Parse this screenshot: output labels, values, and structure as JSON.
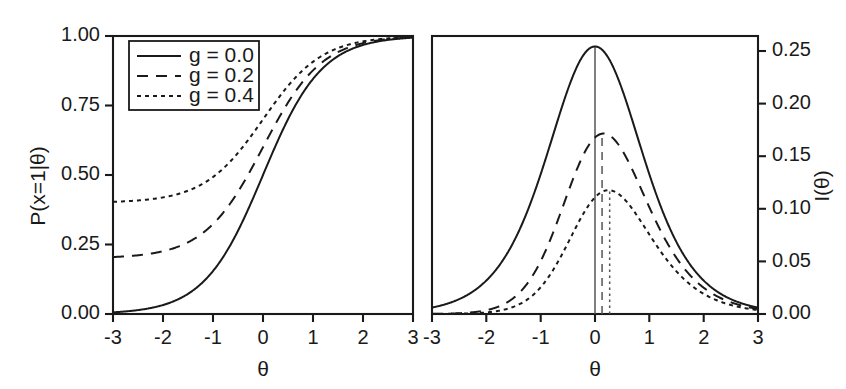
{
  "figure": {
    "background": "#ffffff",
    "ink_color": "#1a1a1a",
    "vline_color": "#555555"
  },
  "legend": {
    "position": "top-left-of-left-panel",
    "entries": [
      {
        "label": "g = 0.0",
        "style": "solid"
      },
      {
        "label": "g = 0.2",
        "style": "dashed"
      },
      {
        "label": "g = 0.4",
        "style": "dotted"
      }
    ]
  },
  "left_panel": {
    "xlabel": "θ",
    "ylabel": "P(x=1|θ)",
    "xticks": [
      "-3",
      "-2",
      "-1",
      "0",
      "1",
      "2",
      "3"
    ],
    "yticks": [
      "0.00",
      "0.25",
      "0.50",
      "0.75",
      "1.00"
    ]
  },
  "right_panel": {
    "xlabel": "θ",
    "ylabel": "I(θ)",
    "xticks": [
      "-3",
      "-2",
      "-1",
      "0",
      "1",
      "2",
      "3"
    ],
    "yticks": [
      "0.00",
      "0.05",
      "0.10",
      "0.15",
      "0.20",
      "0.25"
    ]
  },
  "chart_data": [
    {
      "type": "line",
      "panel": "left",
      "title": "",
      "xlabel": "θ",
      "ylabel": "P(x=1|θ)",
      "xlim": [
        -3,
        3
      ],
      "ylim": [
        0,
        1
      ],
      "xticks": [
        -3,
        -2,
        -1,
        0,
        1,
        2,
        3
      ],
      "yticks": [
        0.0,
        0.25,
        0.5,
        0.75,
        1.0
      ],
      "grid": false,
      "legend_position": "upper left",
      "x": [
        -3,
        -2.75,
        -2.5,
        -2.25,
        -2,
        -1.75,
        -1.5,
        -1.25,
        -1,
        -0.75,
        -0.5,
        -0.25,
        0,
        0.25,
        0.5,
        0.75,
        1,
        1.25,
        1.5,
        1.75,
        2,
        2.25,
        2.5,
        2.75,
        3
      ],
      "series": [
        {
          "name": "g = 0.0",
          "style": "solid",
          "values": [
            0.006,
            0.009,
            0.014,
            0.021,
            0.032,
            0.048,
            0.071,
            0.104,
            0.151,
            0.213,
            0.297,
            0.396,
            0.5,
            0.604,
            0.703,
            0.787,
            0.849,
            0.896,
            0.929,
            0.952,
            0.968,
            0.979,
            0.986,
            0.991,
            0.994
          ]
        },
        {
          "name": "g = 0.2",
          "style": "dashed",
          "values": [
            0.205,
            0.207,
            0.211,
            0.217,
            0.226,
            0.238,
            0.257,
            0.283,
            0.321,
            0.37,
            0.438,
            0.517,
            0.6,
            0.683,
            0.762,
            0.83,
            0.879,
            0.917,
            0.943,
            0.961,
            0.974,
            0.983,
            0.989,
            0.993,
            0.995
          ]
        },
        {
          "name": "g = 0.4",
          "style": "dotted",
          "values": [
            0.404,
            0.406,
            0.409,
            0.413,
            0.419,
            0.429,
            0.443,
            0.462,
            0.491,
            0.528,
            0.578,
            0.638,
            0.7,
            0.762,
            0.822,
            0.872,
            0.91,
            0.938,
            0.957,
            0.971,
            0.981,
            0.987,
            0.992,
            0.995,
            0.996
          ]
        }
      ]
    },
    {
      "type": "line",
      "panel": "right",
      "title": "",
      "xlabel": "θ",
      "ylabel": "I(θ)",
      "xlim": [
        -3,
        3
      ],
      "ylim": [
        0,
        0.265
      ],
      "xticks": [
        -3,
        -2,
        -1,
        0,
        1,
        2,
        3
      ],
      "yticks": [
        0.0,
        0.05,
        0.1,
        0.15,
        0.2,
        0.25
      ],
      "grid": false,
      "legend_position": "none",
      "x": [
        -3,
        -2.75,
        -2.5,
        -2.25,
        -2,
        -1.75,
        -1.5,
        -1.25,
        -1,
        -0.75,
        -0.5,
        -0.25,
        0,
        0.25,
        0.5,
        0.75,
        1,
        1.25,
        1.5,
        1.75,
        2,
        2.25,
        2.5,
        2.75,
        3
      ],
      "series": [
        {
          "name": "g = 0.0",
          "style": "solid",
          "values": [
            0.0059,
            0.0092,
            0.0142,
            0.0216,
            0.0323,
            0.047,
            0.0661,
            0.089,
            0.1139,
            0.1378,
            0.1571,
            0.169,
            0.1731,
            0.169,
            0.1571,
            0.1378,
            0.1139,
            0.089,
            0.0661,
            0.047,
            0.0323,
            0.0216,
            0.0142,
            0.0092,
            0.0059
          ],
          "peak": {
            "x": 0.0,
            "y": 0.255
          },
          "vline_at": 0.0
        },
        {
          "name": "g = 0.2",
          "style": "dashed",
          "values": [
            0.0002,
            0.0005,
            0.001,
            0.0021,
            0.0042,
            0.0082,
            0.0154,
            0.0275,
            0.0459,
            0.0703,
            0.0968,
            0.1177,
            0.127,
            0.1235,
            0.1093,
            0.0885,
            0.0661,
            0.0461,
            0.0303,
            0.0189,
            0.0113,
            0.0066,
            0.0038,
            0.0021,
            0.0012
          ],
          "peak": {
            "x": 0.13,
            "y": 0.172
          },
          "vline_at": 0.13
        },
        {
          "name": "g = 0.4",
          "style": "dotted",
          "values": [
            5e-05,
            0.0001,
            0.0003,
            0.0007,
            0.0016,
            0.0035,
            0.0073,
            0.0145,
            0.0268,
            0.0448,
            0.0656,
            0.0834,
            0.0917,
            0.0892,
            0.0779,
            0.0618,
            0.0451,
            0.0306,
            0.0196,
            0.0119,
            0.007,
            0.004,
            0.0022,
            0.0012,
            0.0007
          ],
          "peak": {
            "x": 0.27,
            "y": 0.118
          },
          "vline_at": 0.27
        }
      ]
    }
  ]
}
